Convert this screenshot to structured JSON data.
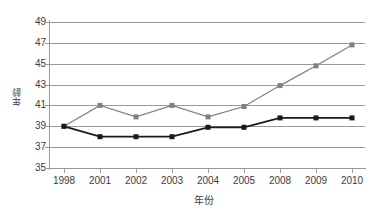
{
  "chart_data": {
    "type": "line",
    "title": "",
    "subtitle": "",
    "xlabel": "年份",
    "ylabel": "年龄",
    "categories": [
      "1998",
      "2001",
      "2002",
      "2003",
      "2004",
      "2005",
      "2008",
      "2009",
      "2010"
    ],
    "ylim": [
      35,
      49
    ],
    "yticks": [
      35,
      37,
      39,
      41,
      43,
      45,
      47,
      49
    ],
    "grid": true,
    "legend": "none",
    "series": [
      {
        "name": "series-gray",
        "color": "#808080",
        "marker": "square",
        "values": [
          39.0,
          41.0,
          39.9,
          41.0,
          39.9,
          40.9,
          42.9,
          44.8,
          46.8
        ]
      },
      {
        "name": "series-black",
        "color": "#1a1a1a",
        "marker": "square",
        "values": [
          39.0,
          38.0,
          38.0,
          38.0,
          38.9,
          38.9,
          39.8,
          39.8,
          39.8
        ]
      }
    ],
    "colors": {
      "gridline": "#9a9a9a",
      "axis": "#9a9a9a",
      "text": "#3c3c3c",
      "background": "#ffffff"
    }
  }
}
